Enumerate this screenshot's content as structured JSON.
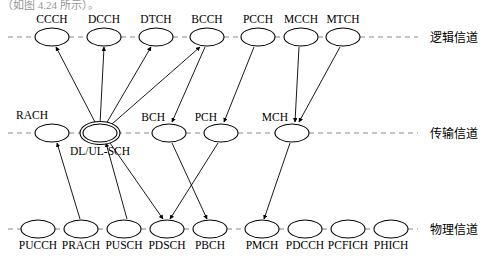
{
  "page": {
    "clipped_header": "（如图 4.24 所示）。",
    "width": 489,
    "height": 259,
    "background": "#ffffff",
    "stroke_color": "#000000",
    "axis_color": "#8a8a8a"
  },
  "rows": [
    {
      "id": "logical",
      "label": "逻辑信道",
      "y": 37,
      "label_x": 430,
      "axis_x1": 8,
      "axis_x2": 418
    },
    {
      "id": "transport",
      "label": "传输信道",
      "y": 133,
      "label_x": 430,
      "axis_x1": 8,
      "axis_x2": 418
    },
    {
      "id": "physical",
      "label": "物理信道",
      "y": 229,
      "label_x": 430,
      "axis_x1": 8,
      "axis_x2": 418
    }
  ],
  "nodes": [
    {
      "id": "CCCH",
      "label": "CCCH",
      "row": "logical",
      "cx": 52,
      "cy": 37,
      "rx": 17,
      "ry": 9,
      "label_pos": "above",
      "label_dy": -14
    },
    {
      "id": "DCCH",
      "label": "DCCH",
      "row": "logical",
      "cx": 104,
      "cy": 37,
      "rx": 17,
      "ry": 9,
      "label_pos": "above",
      "label_dy": -14
    },
    {
      "id": "DTCH",
      "label": "DTCH",
      "row": "logical",
      "cx": 156,
      "cy": 37,
      "rx": 17,
      "ry": 9,
      "label_pos": "above",
      "label_dy": -14
    },
    {
      "id": "BCCH",
      "label": "BCCH",
      "row": "logical",
      "cx": 207,
      "cy": 37,
      "rx": 17,
      "ry": 9,
      "label_pos": "above",
      "label_dy": -14
    },
    {
      "id": "PCCH",
      "label": "PCCH",
      "row": "logical",
      "cx": 258,
      "cy": 37,
      "rx": 17,
      "ry": 9,
      "label_pos": "above",
      "label_dy": -14
    },
    {
      "id": "MCCH",
      "label": "MCCH",
      "row": "logical",
      "cx": 301,
      "cy": 37,
      "rx": 17,
      "ry": 9,
      "label_pos": "above",
      "label_dy": -14
    },
    {
      "id": "MTCH",
      "label": "MTCH",
      "row": "logical",
      "cx": 343,
      "cy": 37,
      "rx": 17,
      "ry": 9,
      "label_pos": "above",
      "label_dy": -14
    },
    {
      "id": "RACH",
      "label": "RACH",
      "row": "transport",
      "cx": 52,
      "cy": 133,
      "rx": 17,
      "ry": 9,
      "label_pos": "above-left",
      "label_dy": -14
    },
    {
      "id": "DLULSCH",
      "label": "DL/UL-SCH",
      "row": "transport",
      "cx": 100,
      "cy": 133,
      "rx": 17,
      "ry": 9,
      "label_pos": "below",
      "label_dy": 22,
      "double": true
    },
    {
      "id": "BCH",
      "label": "BCH",
      "row": "transport",
      "cx": 169,
      "cy": 133,
      "rx": 17,
      "ry": 9,
      "label_pos": "above-left",
      "label_dy": -12
    },
    {
      "id": "PCH",
      "label": "PCH",
      "row": "transport",
      "cx": 221,
      "cy": 133,
      "rx": 17,
      "ry": 9,
      "label_pos": "above-left",
      "label_dy": -12
    },
    {
      "id": "MCH",
      "label": "MCH",
      "row": "transport",
      "cx": 292,
      "cy": 133,
      "rx": 17,
      "ry": 9,
      "label_pos": "above-left",
      "label_dy": -12
    },
    {
      "id": "PUCCH",
      "label": "PUCCH",
      "row": "physical",
      "cx": 38,
      "cy": 229,
      "rx": 17,
      "ry": 9,
      "label_pos": "below",
      "label_dy": 20
    },
    {
      "id": "PRACH",
      "label": "PRACH",
      "row": "physical",
      "cx": 81,
      "cy": 229,
      "rx": 17,
      "ry": 9,
      "label_pos": "below",
      "label_dy": 20
    },
    {
      "id": "PUSCH",
      "label": "PUSCH",
      "row": "physical",
      "cx": 124,
      "cy": 229,
      "rx": 17,
      "ry": 9,
      "label_pos": "below",
      "label_dy": 20
    },
    {
      "id": "PDSCH",
      "label": "PDSCH",
      "row": "physical",
      "cx": 167,
      "cy": 229,
      "rx": 17,
      "ry": 9,
      "label_pos": "below",
      "label_dy": 20
    },
    {
      "id": "PBCH",
      "label": "PBCH",
      "row": "physical",
      "cx": 210,
      "cy": 229,
      "rx": 17,
      "ry": 9,
      "label_pos": "below",
      "label_dy": 20
    },
    {
      "id": "PMCH",
      "label": "PMCH",
      "row": "physical",
      "cx": 262,
      "cy": 229,
      "rx": 17,
      "ry": 9,
      "label_pos": "below",
      "label_dy": 20
    },
    {
      "id": "PDCCH",
      "label": "PDCCH",
      "row": "physical",
      "cx": 305,
      "cy": 229,
      "rx": 17,
      "ry": 9,
      "label_pos": "below",
      "label_dy": 20
    },
    {
      "id": "PCFICH",
      "label": "PCFICH",
      "row": "physical",
      "cx": 348,
      "cy": 229,
      "rx": 17,
      "ry": 9,
      "label_pos": "below",
      "label_dy": 20
    },
    {
      "id": "PHICH",
      "label": "PHICH",
      "row": "physical",
      "cx": 391,
      "cy": 229,
      "rx": 17,
      "ry": 9,
      "label_pos": "below",
      "label_dy": 20
    }
  ],
  "links": [
    {
      "from": "DLULSCH",
      "to": "CCCH",
      "x1": 96,
      "y1": 124,
      "x2": 56,
      "y2": 47
    },
    {
      "from": "DLULSCH",
      "to": "DCCH",
      "x1": 100,
      "y1": 124,
      "x2": 104,
      "y2": 47
    },
    {
      "from": "DLULSCH",
      "to": "DTCH",
      "x1": 106,
      "y1": 124,
      "x2": 151,
      "y2": 47
    },
    {
      "from": "DLULSCH",
      "to": "BCCH",
      "x1": 112,
      "y1": 124,
      "x2": 200,
      "y2": 47
    },
    {
      "from": "BCCH",
      "to": "BCH",
      "x1": 205,
      "y1": 47,
      "x2": 172,
      "y2": 122
    },
    {
      "from": "PCCH",
      "to": "PCH",
      "x1": 254,
      "y1": 47,
      "x2": 224,
      "y2": 122
    },
    {
      "from": "MCCH",
      "to": "MCH",
      "x1": 299,
      "y1": 47,
      "x2": 295,
      "y2": 122
    },
    {
      "from": "MTCH",
      "to": "MCH",
      "x1": 340,
      "y1": 47,
      "x2": 299,
      "y2": 122
    },
    {
      "from": "PRACH",
      "to": "RACH",
      "x1": 80,
      "y1": 219,
      "x2": 57,
      "y2": 143
    },
    {
      "from": "PUSCH",
      "to": "DLULSCH",
      "x1": 127,
      "y1": 219,
      "x2": 106,
      "y2": 143
    },
    {
      "from": "DLULSCH",
      "to": "PDSCH",
      "x1": 110,
      "y1": 143,
      "x2": 163,
      "y2": 219
    },
    {
      "from": "BCH",
      "to": "PBCH",
      "x1": 172,
      "y1": 143,
      "x2": 207,
      "y2": 219
    },
    {
      "from": "PCH",
      "to": "PDSCH",
      "x1": 218,
      "y1": 143,
      "x2": 170,
      "y2": 219
    },
    {
      "from": "MCH",
      "to": "PMCH",
      "x1": 290,
      "y1": 143,
      "x2": 264,
      "y2": 219
    }
  ]
}
